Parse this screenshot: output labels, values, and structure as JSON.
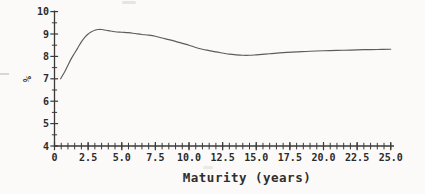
{
  "chart_data": {
    "type": "line",
    "title": "",
    "xlabel": "Maturity (years)",
    "ylabel": "%",
    "xlim": [
      0,
      25.3
    ],
    "ylim": [
      4,
      10
    ],
    "x_ticks": [
      0,
      2.5,
      5,
      7.5,
      10,
      12.5,
      15,
      17.5,
      20,
      22.5,
      25
    ],
    "x_tick_labels": [
      "0",
      "2.5",
      "5.0",
      "7.5",
      "10.0",
      "12.5",
      "15.0",
      "17.5",
      "20.0",
      "22.5",
      "25.0"
    ],
    "y_ticks": [
      4,
      5,
      6,
      7,
      8,
      9,
      10
    ],
    "y_tick_labels": [
      "4",
      "5",
      "6",
      "7",
      "8",
      "9",
      "10"
    ],
    "minor_tick_step": 0.5,
    "grid": false,
    "legend": false,
    "series": [
      {
        "name": "spot-yield-curve",
        "x": [
          0.45,
          0.75,
          1,
          1.25,
          1.5,
          1.75,
          2,
          2.25,
          2.5,
          2.75,
          3,
          3.25,
          3.5,
          4,
          4.5,
          5,
          5.5,
          6,
          6.5,
          7,
          7.5,
          8,
          8.5,
          9,
          9.5,
          10,
          10.5,
          11,
          11.5,
          12,
          12.5,
          13,
          13.5,
          14,
          14.5,
          15,
          16,
          17,
          18,
          19,
          20,
          21,
          22,
          23,
          24,
          25
        ],
        "y": [
          7.0,
          7.3,
          7.6,
          7.9,
          8.15,
          8.4,
          8.65,
          8.85,
          9.0,
          9.1,
          9.17,
          9.2,
          9.2,
          9.15,
          9.1,
          9.08,
          9.06,
          9.02,
          8.98,
          8.95,
          8.9,
          8.82,
          8.75,
          8.67,
          8.58,
          8.5,
          8.4,
          8.32,
          8.26,
          8.2,
          8.15,
          8.1,
          8.07,
          8.05,
          8.05,
          8.07,
          8.12,
          8.17,
          8.2,
          8.23,
          8.25,
          8.27,
          8.28,
          8.3,
          8.31,
          8.32
        ]
      }
    ],
    "colors": {
      "curve": "#5c5c5c",
      "axis": "#3a3a3a",
      "text": "#2b2b2b",
      "background": "#fbfaf8"
    }
  }
}
